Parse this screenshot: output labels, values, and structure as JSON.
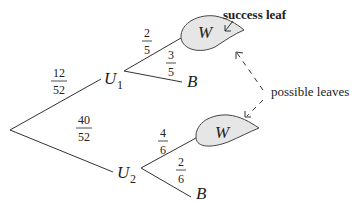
{
  "diagram": {
    "type": "probability-tree",
    "root": {
      "label": ""
    },
    "level1": [
      {
        "node": "U",
        "sub": "1",
        "prob_num": "12",
        "prob_den": "52"
      },
      {
        "node": "U",
        "sub": "2",
        "prob_num": "40",
        "prob_den": "52"
      }
    ],
    "u1_branches": [
      {
        "leaf": "W",
        "prob_num": "2",
        "prob_den": "5",
        "highlighted": true
      },
      {
        "leaf": "B",
        "prob_num": "3",
        "prob_den": "5",
        "highlighted": false
      }
    ],
    "u2_branches": [
      {
        "leaf": "W",
        "prob_num": "4",
        "prob_den": "6",
        "highlighted": true
      },
      {
        "leaf": "B",
        "prob_num": "2",
        "prob_den": "6",
        "highlighted": false
      }
    ],
    "annotations": {
      "success_leaf": "success leaf",
      "possible_leaves": "possible leaves"
    },
    "colors": {
      "leaf_fill": "#e6e6e6",
      "line": "#333333"
    }
  }
}
